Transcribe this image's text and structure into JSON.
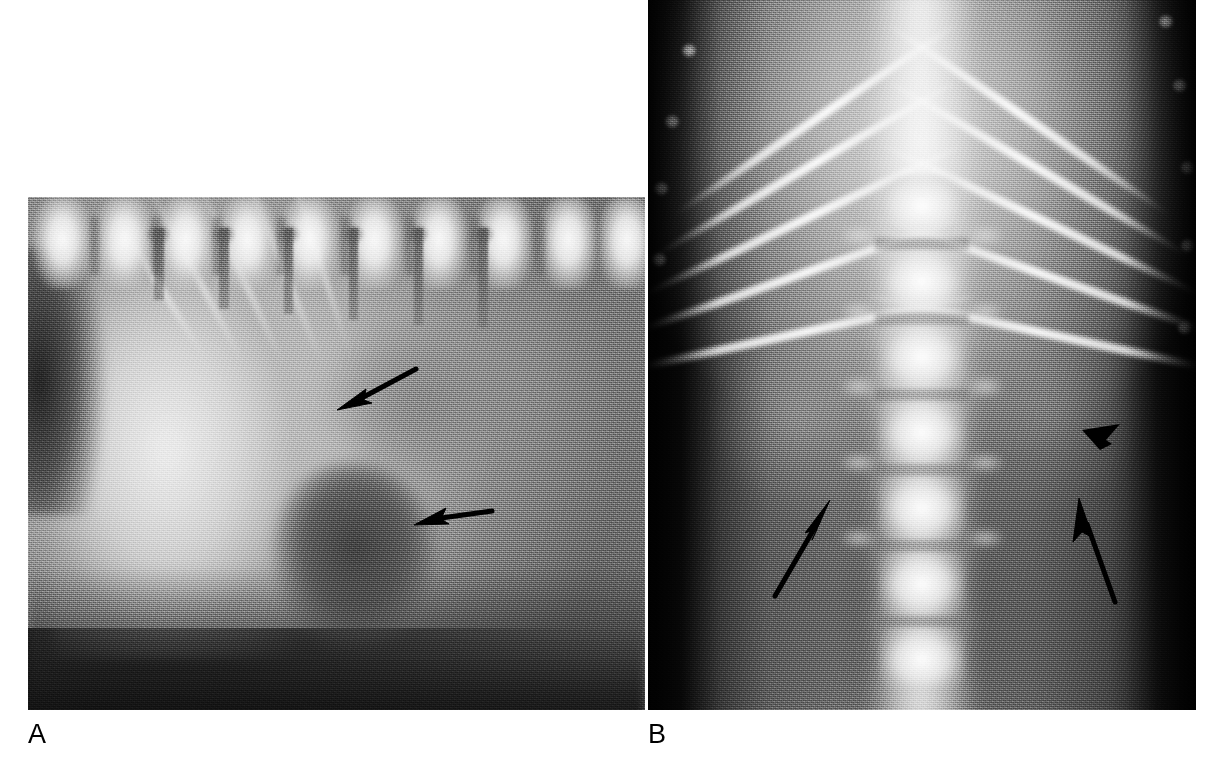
{
  "figure": {
    "type": "radiograph-figure",
    "modality": "Radiograph",
    "background_color": "#ffffff",
    "annotation_color": "#000000",
    "panel_count": 2
  },
  "panels": [
    {
      "id": "panel-a",
      "label": "A",
      "view": "lateral abdominal radiograph",
      "anatomy_visible": [
        "lumbar vertebrae",
        "spinous processes",
        "ribs",
        "liver",
        "gas-filled bowel loop",
        "mid-abdominal soft tissue mass"
      ],
      "annotations": [
        {
          "name": "arrow-a-upper",
          "kind": "arrow",
          "direction": "down-left",
          "x": 330,
          "y": 365,
          "length": 72,
          "describes": "ill-defined cranial mass margin"
        },
        {
          "name": "arrow-a-lower",
          "kind": "arrow",
          "direction": "left",
          "x": 410,
          "y": 505,
          "length": 68,
          "describes": "caudal margin of mass effect"
        }
      ]
    },
    {
      "id": "panel-b",
      "label": "B",
      "view": "ventrodorsal abdominal radiograph",
      "anatomy_visible": [
        "ribs",
        "costal cartilage tips",
        "lumbar vertebral bodies",
        "transverse processes",
        "paraspinal soft tissue opacities"
      ],
      "annotations": [
        {
          "name": "arrow-b-left",
          "kind": "arrow",
          "direction": "up-right",
          "x": 775,
          "y": 580,
          "length": 95,
          "describes": "left paraspinal soft tissue opacity"
        },
        {
          "name": "arrow-b-right",
          "kind": "arrow",
          "direction": "up",
          "x": 1110,
          "y": 595,
          "length": 98,
          "describes": "right paraspinal soft tissue opacity"
        },
        {
          "name": "arrowhead-b",
          "kind": "arrowhead",
          "direction": "down-left",
          "x": 1088,
          "y": 428,
          "describes": "focal margin of lesion"
        }
      ]
    }
  ],
  "labels": {
    "panel_a": "A",
    "panel_b": "B"
  },
  "geometry": {
    "canvas_width": 1226,
    "canvas_height": 774,
    "panel_a": {
      "x": 28,
      "y": 197,
      "width": 617,
      "height": 513
    },
    "panel_b": {
      "x": 648,
      "y": 0,
      "width": 548,
      "height": 710
    }
  }
}
